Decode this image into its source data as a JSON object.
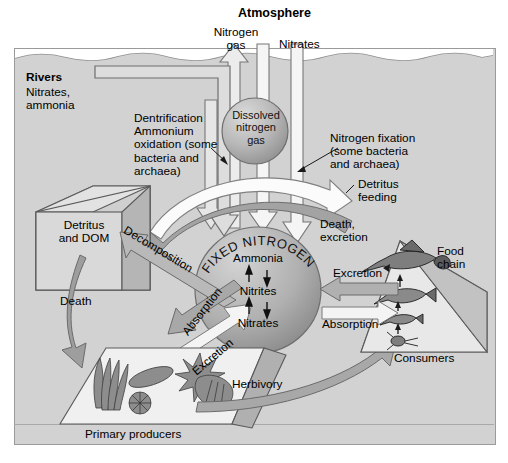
{
  "diagram": {
    "atmosphere_label": "Atmosphere",
    "zones": {
      "atmosphere": "Atmosphere",
      "ocean": "Ocean"
    },
    "colors": {
      "ocean_fill": "#d2d2d2",
      "atmosphere_fill": "#ffffff",
      "sphere_fill": "#b4b4b4",
      "arrow_gray": "#9c9c9c",
      "arrow_white": "#f2f2f2",
      "outline": "#4a4a4a"
    },
    "fluxes": {
      "nitrogen_gas": "Nitrogen\ngas",
      "nitrates_in": "Nitrates",
      "dissolved_nitrogen_gas": "Dissolved\nnitrogen\ngas",
      "denitrification": "Dentrification\nAmmonium\noxidation (some\nbacteria and\narchaea)",
      "nitrogen_fixation": "Nitrogen fixation\n(some bacteria\nand archaea)",
      "detritus_feeding": "Detritus\nfeeding",
      "death_excretion": "Death,\nexcretion",
      "decomposition": "Decomposition",
      "death": "Death",
      "absorption_left": "Absorption",
      "excretion_left": "Excretion",
      "excretion_right": "Excretion",
      "absorption_right": "Absorption",
      "herbivory": "Herbivory"
    },
    "rivers": {
      "title": "Rivers",
      "contents": "Nitrates,\nammonia"
    },
    "pools": {
      "detritus": "Detritus\nand DOM",
      "fixed_nitrogen": "FIXED NITROGEN",
      "fixed_nitrogen_species": [
        "Ammonia",
        "Nitrites",
        "Nitrates"
      ],
      "primary_producers": "Primary producers",
      "consumers": "Consumers",
      "food_chain": "Food\nchain"
    }
  }
}
